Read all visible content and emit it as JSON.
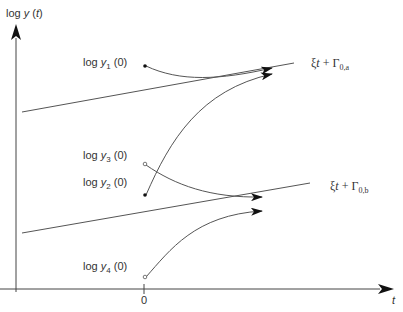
{
  "diagram": {
    "y_axis_label": {
      "prefix": "log ",
      "var": "y",
      "arg": " (",
      "t": "t",
      "close": ")"
    },
    "x_axis_label": "t",
    "origin_tick_label": "0",
    "initial_labels": [
      {
        "id": "y1",
        "prefix": "log ",
        "var": "y",
        "sub": "1",
        "suffix": " (0)"
      },
      {
        "id": "y3",
        "prefix": "log ",
        "var": "y",
        "sub": "3",
        "suffix": " (0)"
      },
      {
        "id": "y2",
        "prefix": "log ",
        "var": "y",
        "sub": "2",
        "suffix": " (0)"
      },
      {
        "id": "y4",
        "prefix": "log ",
        "var": "y",
        "sub": "4",
        "suffix": " (0)"
      }
    ],
    "asymptote_a": {
      "xi": "ξ",
      "t": "t",
      "plus": " + Γ",
      "sub": "0,a"
    },
    "asymptote_b": {
      "xi": "ξ",
      "t": "t",
      "plus": " + Γ",
      "sub": "0,b"
    },
    "colors": {
      "line": "#555555",
      "axis": "#444444",
      "arrow": "#111111"
    }
  }
}
